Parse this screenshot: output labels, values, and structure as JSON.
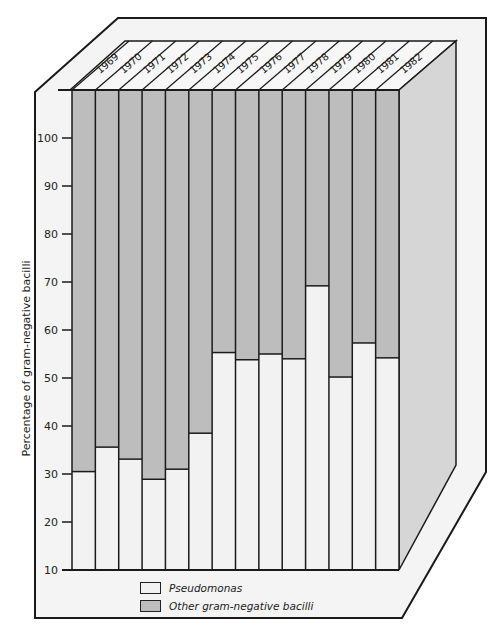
{
  "chart_data": {
    "type": "bar",
    "stacked": true,
    "style": "3d-box",
    "title": "",
    "xlabel": "",
    "ylabel": "Percentage of gram-negative bacilli",
    "ylim": [
      10,
      110
    ],
    "yticks": [
      10,
      20,
      30,
      40,
      50,
      60,
      70,
      80,
      90,
      100
    ],
    "grid": false,
    "legend_position": "bottom",
    "categories": [
      "1969",
      "1970",
      "1971",
      "1972",
      "1973",
      "1974",
      "1975",
      "1976",
      "1977",
      "1978",
      "1979",
      "1980",
      "1981",
      "1982"
    ],
    "series": [
      {
        "name": "Pseudomonas",
        "color": "#f2f2f2",
        "values": [
          30.5,
          35.6,
          33.1,
          28.9,
          31.0,
          38.5,
          55.3,
          53.8,
          55.0,
          54.0,
          69.2,
          50.2,
          57.3,
          54.2
        ]
      },
      {
        "name": "Other gram-negative bacilli",
        "color": "#bdbdbd",
        "values": [
          79.5,
          74.4,
          76.9,
          81.1,
          79.0,
          71.5,
          54.7,
          56.2,
          55.0,
          56.0,
          40.8,
          59.8,
          52.7,
          55.8
        ]
      }
    ]
  },
  "legend": {
    "pseudomonas_label": "Pseudomonas",
    "other_label": "Other gram-negative bacilli"
  },
  "colors": {
    "pseudomonas": "#f2f2f2",
    "other": "#bdbdbd",
    "side_face": "#d6d6d6",
    "frame": "#f4f4f4",
    "line": "#1a1a1a"
  }
}
